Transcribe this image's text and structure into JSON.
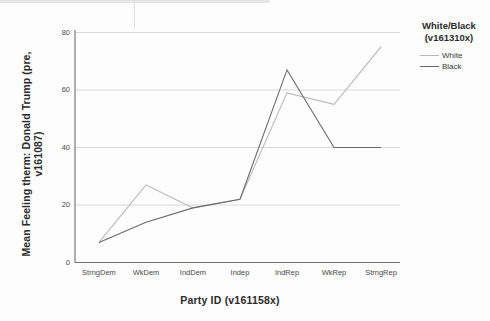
{
  "chart_data": {
    "type": "line",
    "title": "",
    "subtitle": "",
    "xlabel": "Party  ID (v161158x)",
    "ylabel": "Mean Feeling therm: Donald Trump (pre, v161087)",
    "categories": [
      "StrngDem",
      "WkDem",
      "IndDem",
      "Indep",
      "IndRep",
      "WkRep",
      "StrngRep"
    ],
    "series": [
      {
        "name": "White",
        "values": [
          7,
          27,
          19,
          22,
          59,
          55,
          75
        ],
        "color": "#b9b9b9"
      },
      {
        "name": "Black",
        "values": [
          7,
          14,
          19,
          22,
          67,
          40,
          40
        ],
        "color": "#6a6a6a"
      }
    ],
    "ylim": [
      0,
      80
    ],
    "yticks": [
      0,
      20,
      40,
      60,
      80
    ],
    "ytick_labels": [
      "0",
      "20",
      "40",
      "60",
      "80"
    ],
    "grid": true,
    "grid_axis": "y",
    "legend_position": "right",
    "legend_title": "White/Black\n(v161310x)"
  },
  "legend": {
    "title_line1": "White/Black",
    "title_line2": "(v161310x)",
    "items": [
      {
        "label": "White"
      },
      {
        "label": "Black"
      }
    ]
  },
  "axes": {
    "y_title": "Mean Feeling therm: Donald Trump (pre, v161087)",
    "x_title": "Party  ID (v161158x)",
    "y_ticks": [
      "80",
      "60",
      "40",
      "20",
      "0"
    ],
    "x_ticks": [
      "StrngDem",
      "WkDem",
      "IndDem",
      "Indep",
      "IndRep",
      "WkRep",
      "StrngRep"
    ]
  },
  "colors": {
    "white_series": "#b9b9b9",
    "black_series": "#6a6a6a",
    "grid": "#d8d8d8",
    "axis": "#6f6f6f",
    "background": "#fdfdfd"
  }
}
